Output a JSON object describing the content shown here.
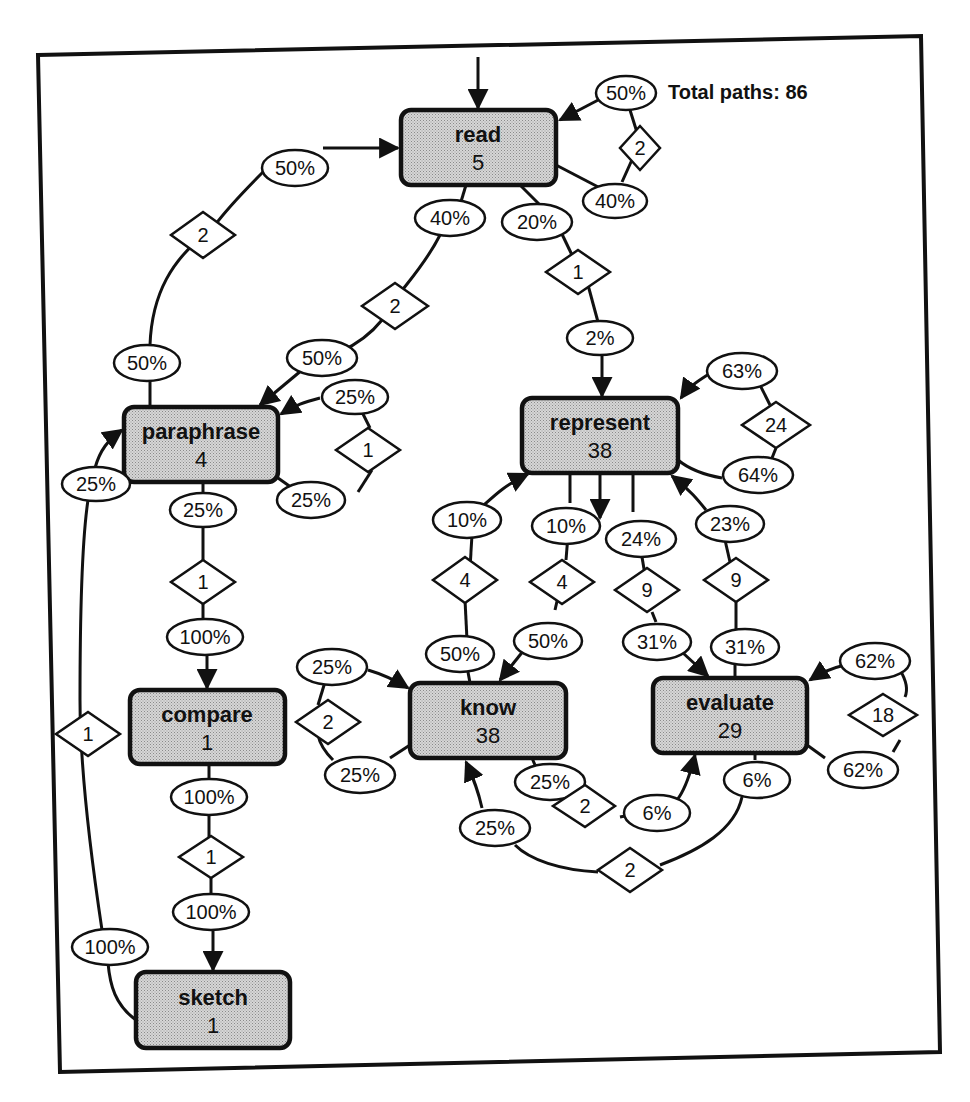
{
  "diagram": {
    "total_paths_label": "Total paths: 86",
    "nodes": [
      {
        "id": "read",
        "name": "read",
        "count": "5"
      },
      {
        "id": "paraphrase",
        "name": "paraphrase",
        "count": "4"
      },
      {
        "id": "compare",
        "name": "compare",
        "count": "1"
      },
      {
        "id": "sketch",
        "name": "sketch",
        "count": "1"
      },
      {
        "id": "represent",
        "name": "represent",
        "count": "38"
      },
      {
        "id": "know",
        "name": "know",
        "count": "38"
      },
      {
        "id": "evaluate",
        "name": "evaluate",
        "count": "29"
      }
    ],
    "edges": [
      {
        "from": "read",
        "to": "read",
        "out_pct": "40%",
        "count": "2",
        "in_pct": "50%"
      },
      {
        "from": "paraphrase",
        "to": "read",
        "out_pct": "50%",
        "count": "2",
        "in_pct": "50%"
      },
      {
        "from": "read",
        "to": "paraphrase",
        "out_pct": "40%",
        "count": "2",
        "in_pct": "50%"
      },
      {
        "from": "read",
        "to": "represent",
        "out_pct": "20%",
        "count": "1",
        "in_pct": "2%"
      },
      {
        "from": "paraphrase",
        "to": "paraphrase",
        "out_pct": "25%",
        "count": "1",
        "in_pct": "25%"
      },
      {
        "from": "paraphrase",
        "to": "compare",
        "out_pct": "25%",
        "count": "1",
        "in_pct": "100%"
      },
      {
        "from": "sketch",
        "to": "paraphrase",
        "out_pct": "100%",
        "count": "1",
        "in_pct": "25%"
      },
      {
        "from": "compare",
        "to": "sketch",
        "out_pct": "100%",
        "count": "1",
        "in_pct": "100%"
      },
      {
        "from": "represent",
        "to": "represent",
        "out_pct": "64%",
        "count": "24",
        "in_pct": "63%"
      },
      {
        "from": "know",
        "to": "represent",
        "out_pct": "50%",
        "count": "4",
        "in_pct": "10%"
      },
      {
        "from": "represent",
        "to": "know",
        "out_pct": "10%",
        "count": "4",
        "in_pct": "50%"
      },
      {
        "from": "represent",
        "to": "evaluate",
        "out_pct": "24%",
        "count": "9",
        "in_pct": "31%"
      },
      {
        "from": "evaluate",
        "to": "represent",
        "out_pct": "31%",
        "count": "9",
        "in_pct": "23%"
      },
      {
        "from": "know",
        "to": "know",
        "out_pct": "25%",
        "count": "2",
        "in_pct": "25%"
      },
      {
        "from": "know",
        "to": "evaluate",
        "out_pct": "25%",
        "count": "2",
        "in_pct": "6%"
      },
      {
        "from": "evaluate",
        "to": "know",
        "out_pct": "6%",
        "count": "2",
        "in_pct": "25%"
      },
      {
        "from": "evaluate",
        "to": "evaluate",
        "out_pct": "62%",
        "count": "18",
        "in_pct": "62%"
      }
    ],
    "labels": {
      "read_self_in": "50%",
      "read_self_count": "2",
      "read_self_out": "40%",
      "para_read_out": "50%",
      "para_read_count": "2",
      "para_read_in": "50%",
      "read_para_out": "40%",
      "read_para_count": "2",
      "read_para_in": "50%",
      "read_rep_out": "20%",
      "read_rep_count": "1",
      "read_rep_in": "2%",
      "para_self_in": "25%",
      "para_self_count": "1",
      "para_self_out": "25%",
      "para_comp_out": "25%",
      "para_comp_count": "1",
      "para_comp_in": "100%",
      "sketch_para_out": "100%",
      "sketch_para_count": "1",
      "sketch_para_in": "25%",
      "comp_sketch_out": "100%",
      "comp_sketch_count": "1",
      "comp_sketch_in": "100%",
      "rep_self_in": "63%",
      "rep_self_count": "24",
      "rep_self_out": "64%",
      "know_rep_out": "50%",
      "know_rep_count": "4",
      "know_rep_in": "10%",
      "rep_know_out": "10%",
      "rep_know_count": "4",
      "rep_know_in": "50%",
      "rep_eval_out": "24%",
      "rep_eval_count": "9",
      "rep_eval_in": "31%",
      "eval_rep_out": "31%",
      "eval_rep_count": "9",
      "eval_rep_in": "23%",
      "know_self_in": "25%",
      "know_self_count": "2",
      "know_self_out": "25%",
      "know_eval_out": "25%",
      "know_eval_count": "2",
      "know_eval_in": "6%",
      "eval_know_out": "6%",
      "eval_know_count": "2",
      "eval_know_in": "25%",
      "eval_self_in": "62%",
      "eval_self_count": "18",
      "eval_self_out": "62%"
    }
  }
}
